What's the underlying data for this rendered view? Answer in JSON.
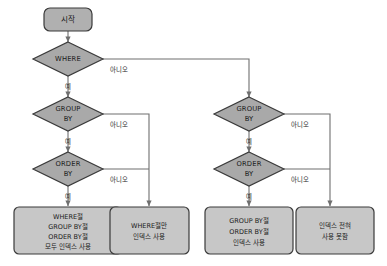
{
  "diagram": {
    "title_text": "",
    "colors": {
      "decision_fill": "#a9a9a9",
      "process_fill": "#c7c7c7",
      "terminator_fill": "#b0b0b0",
      "stroke": "#3a3a3a",
      "connector": "#6f6f6f",
      "text": "#1a1a1a",
      "background": "#ffffff"
    },
    "start": {
      "label": "시작"
    },
    "decisions": [
      {
        "id": "where",
        "label_line1": "WHERE",
        "label_line2": ""
      },
      {
        "id": "group-by-left",
        "label_line1": "GROUP",
        "label_line2": "BY"
      },
      {
        "id": "order-by-left",
        "label_line1": "ORDER",
        "label_line2": "BY"
      },
      {
        "id": "group-by-right",
        "label_line1": "GROUP",
        "label_line2": "BY"
      },
      {
        "id": "order-by-right",
        "label_line1": "ORDER",
        "label_line2": "BY"
      }
    ],
    "edge_labels": {
      "yes": "예",
      "no": "아니오"
    },
    "results": [
      {
        "id": "result-all-index",
        "lines": [
          "WHERE절",
          "GROUP BY절",
          "ORDER BY절",
          "모두 인덱스 사용"
        ]
      },
      {
        "id": "result-where-only",
        "lines": [
          "WHERE절만",
          "인덱스 사용"
        ]
      },
      {
        "id": "result-group-order",
        "lines": [
          "GROUP BY절",
          "ORDER BY절",
          "인덱스 사용"
        ]
      },
      {
        "id": "result-no-index",
        "lines": [
          "인덱스 전혀",
          "사용 못함"
        ]
      }
    ]
  }
}
